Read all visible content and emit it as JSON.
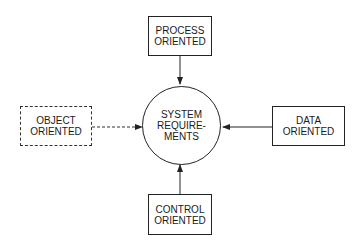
{
  "center": {
    "lines": [
      "SYSTEM",
      "REQUIRE-",
      "MENTS"
    ]
  },
  "nodes": {
    "process": {
      "lines": [
        "PROCESS",
        "ORIENTED"
      ],
      "style": "solid"
    },
    "control": {
      "lines": [
        "CONTROL",
        "ORIENTED"
      ],
      "style": "solid"
    },
    "data": {
      "lines": [
        "DATA",
        "ORIENTED"
      ],
      "style": "solid"
    },
    "object": {
      "lines": [
        "OBJECT",
        "ORIENTED"
      ],
      "style": "dashed"
    }
  },
  "colors": {
    "line": "#222222",
    "background": "#ffffff"
  }
}
